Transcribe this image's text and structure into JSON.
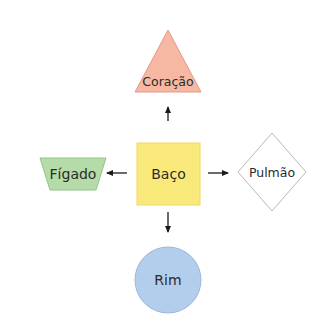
{
  "diagram": {
    "center": {
      "label": "Baço",
      "shape": "square",
      "fill": "#f9e97a",
      "stroke": "#f2d85c"
    },
    "nodes": [
      {
        "id": "top",
        "label": "Coração",
        "shape": "triangle",
        "fill": "#f6b8a2",
        "stroke": "#e39a85",
        "direction": "up"
      },
      {
        "id": "left",
        "label": "Fígado",
        "shape": "trapezoid",
        "fill": "#b4dba8",
        "stroke": "#93c488",
        "direction": "left"
      },
      {
        "id": "right",
        "label": "Pulmão",
        "shape": "diamond",
        "fill": "#ffffff",
        "stroke": "#b8b8b8",
        "direction": "right"
      },
      {
        "id": "bottom",
        "label": "Rim",
        "shape": "circle",
        "fill": "#b3cdec",
        "stroke": "#98b6dc",
        "direction": "down"
      }
    ],
    "arrow_color": "#1a1a1a"
  }
}
